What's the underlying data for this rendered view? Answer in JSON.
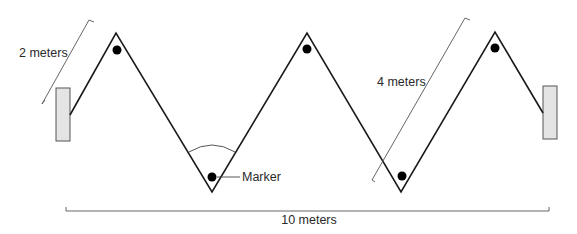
{
  "diagram": {
    "labels": {
      "left_span": "2 meters",
      "diagonal_span": "4 meters",
      "total_width": "10 meters",
      "marker": "Marker"
    },
    "colors": {
      "line": "#1a1a1a",
      "wall_fill": "#e4e4e4",
      "wall_stroke": "#555555",
      "dimension": "#555555",
      "dot": "#000000"
    },
    "zigzag_points": [
      [
        70,
        115
      ],
      [
        116,
        33
      ],
      [
        212,
        192
      ],
      [
        307,
        33
      ],
      [
        401,
        192
      ],
      [
        495,
        32
      ],
      [
        543,
        113
      ]
    ],
    "markers": [
      [
        117,
        50
      ],
      [
        307,
        49
      ],
      [
        212,
        177
      ],
      [
        402,
        176
      ],
      [
        495,
        48
      ]
    ],
    "walls": [
      {
        "name": "left-wall",
        "x": 56,
        "y": 88,
        "w": 14,
        "h": 53
      },
      {
        "name": "right-wall",
        "x": 543,
        "y": 86,
        "w": 14,
        "h": 53
      }
    ]
  }
}
